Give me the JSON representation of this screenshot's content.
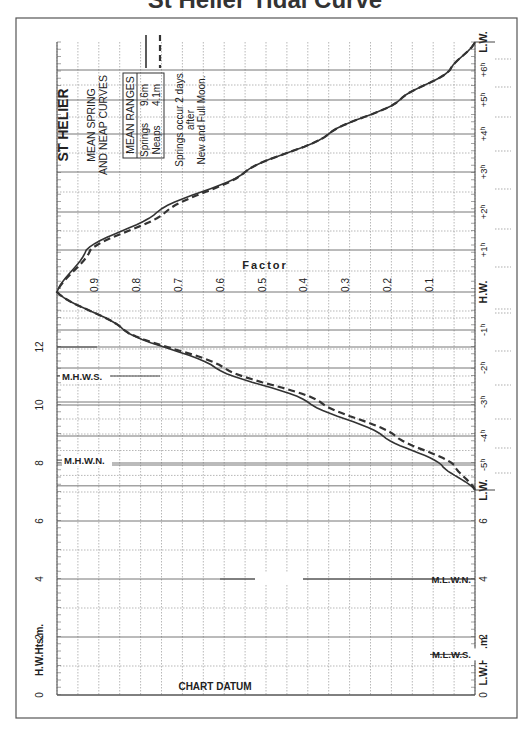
{
  "page": {
    "title_fragment": "St Helier Tidal Curve"
  },
  "legend": {
    "port": "ST HELIER",
    "subtitle_line1": "MEAN SPRING",
    "subtitle_line2": "AND NEAP CURVES",
    "ranges_header": "MEAN RANGES",
    "springs_label": "Springs",
    "springs_value": "9.6m",
    "neaps_label": "Neaps",
    "neaps_value": "4.1m",
    "note_line1": "Springs occur 2 days",
    "note_line2": "after",
    "note_line3": "New and Full Moon."
  },
  "axes": {
    "factor_title": "Factor",
    "factor_ticks": [
      "0.9",
      "0.8",
      "0.7",
      "0.6",
      "0.5",
      "0.4",
      "0.3",
      "0.2",
      "0.1"
    ],
    "hw_heights_label": "H.W.Hts.m.",
    "lw_heights_label": "L.W.Hts.m.",
    "hw_height_ticks": [
      "0",
      "2",
      "4",
      "6",
      "8",
      "10",
      "12"
    ],
    "lw_height_ticks": [
      "0",
      "2",
      "4",
      "6"
    ],
    "time_ticks": [
      "L.W.",
      "-5ʰ",
      "-4ʰ",
      "-3ʰ",
      "-2ʰ",
      "-1ʰ",
      "H.W.",
      "+1ʰ",
      "+2ʰ",
      "+3ʰ",
      "+4ʰ",
      "+5ʰ",
      "+6ʰ",
      "L.W."
    ],
    "chart_datum": "CHART DATUM"
  },
  "levels": {
    "mhws": "M.H.W.S.",
    "mhwn": "M.H.W.N.",
    "mlwn": "M.L.W.N.",
    "mlws": "M.L.W.S."
  },
  "colors": {
    "line": "#333333",
    "grid": "#888888",
    "frame": "#555555"
  },
  "chart_data": {
    "type": "line",
    "xlabel": "Time relative to H.W. (hours)",
    "ylabel": "Factor",
    "ylim": [
      0,
      1
    ],
    "x": [
      -6.2,
      -5,
      -4,
      -3,
      -2,
      -1,
      0,
      1,
      2,
      3,
      4,
      5,
      6,
      6.5
    ],
    "series": [
      {
        "name": "Springs (9.6m)",
        "style": "solid",
        "values": [
          0.0,
          0.08,
          0.22,
          0.4,
          0.62,
          0.84,
          1.0,
          0.93,
          0.76,
          0.55,
          0.35,
          0.18,
          0.06,
          0.0
        ]
      },
      {
        "name": "Neaps (4.1m)",
        "style": "dashed",
        "values": [
          0.0,
          0.05,
          0.19,
          0.37,
          0.6,
          0.84,
          1.0,
          0.92,
          0.74,
          0.55,
          0.35,
          0.18,
          0.06,
          0.0
        ]
      }
    ],
    "height_scale": {
      "hw_heights_m": [
        0,
        2,
        4,
        6,
        8,
        10,
        12
      ],
      "lw_heights_m": [
        0,
        2,
        4,
        6
      ],
      "MHWS_m": 11.0,
      "MHWN_m": 8.1,
      "MLWN_m": 4.0,
      "MLWS_m": 1.4
    },
    "annotations": [
      "Springs occur 2 days after New and Full Moon.",
      "CHART DATUM"
    ],
    "grid": true
  }
}
